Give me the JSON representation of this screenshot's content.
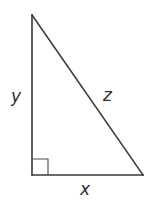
{
  "diagram": {
    "type": "right-triangle",
    "vertices": {
      "top": [
        32,
        15
      ],
      "right_angle": [
        32,
        175
      ],
      "bottom_right": [
        143,
        175
      ]
    },
    "right_angle_marker_size": 16,
    "labels": {
      "vertical_leg": "y",
      "hypotenuse": "z",
      "horizontal_leg": "x"
    },
    "colors": {
      "stroke": "#3a3a3a",
      "text": "#2e2e2e",
      "background": "#ffffff"
    }
  }
}
